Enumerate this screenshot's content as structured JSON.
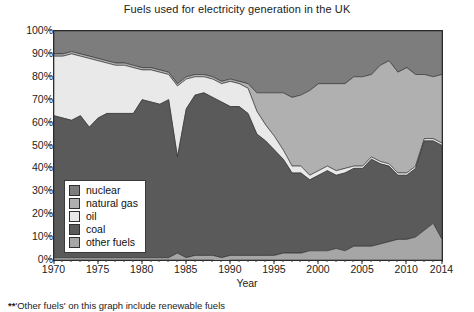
{
  "chart_data": {
    "type": "area",
    "stacked": true,
    "stack_order_top_to_bottom": [
      "nuclear",
      "natural gas",
      "oil",
      "coal",
      "other fuels"
    ],
    "title": "Fuels used for electricity generation in the UK",
    "xlabel": "Year",
    "ylabel": "",
    "xlim": [
      1970,
      2014
    ],
    "ylim": [
      0,
      100
    ],
    "grid": false,
    "legend_position": "inside-lower-left",
    "unit": "percent of electricity generated",
    "x": [
      1970,
      1971,
      1972,
      1973,
      1974,
      1975,
      1976,
      1977,
      1978,
      1979,
      1980,
      1981,
      1982,
      1983,
      1984,
      1985,
      1986,
      1987,
      1988,
      1989,
      1990,
      1991,
      1992,
      1993,
      1994,
      1995,
      1996,
      1997,
      1998,
      1999,
      2000,
      2001,
      2002,
      2003,
      2004,
      2005,
      2006,
      2007,
      2008,
      2009,
      2010,
      2011,
      2012,
      2013,
      2014
    ],
    "xticks": [
      1970,
      1975,
      1980,
      1985,
      1990,
      1995,
      2000,
      2005,
      2010,
      2014
    ],
    "yticks": [
      "0%",
      "10%",
      "20%",
      "30%",
      "40%",
      "50%",
      "60%",
      "70%",
      "80%",
      "90%",
      "100%"
    ],
    "series": [
      {
        "name": "nuclear",
        "color": "#7d7d7d",
        "values": [
          10,
          10,
          9,
          10,
          11,
          12,
          13,
          14,
          14,
          15,
          16,
          16,
          17,
          18,
          23,
          20,
          19,
          19,
          20,
          22,
          21,
          22,
          23,
          27,
          27,
          27,
          27,
          29,
          28,
          26,
          23,
          23,
          23,
          23,
          20,
          20,
          19,
          15,
          13,
          18,
          16,
          19,
          19,
          20,
          19
        ]
      },
      {
        "name": "natural gas",
        "color": "#b0b0b0",
        "values": [
          1,
          1,
          1,
          1,
          1,
          1,
          1,
          1,
          1,
          1,
          1,
          1,
          1,
          1,
          1,
          1,
          1,
          1,
          1,
          1,
          1,
          1,
          2,
          8,
          14,
          19,
          25,
          30,
          31,
          37,
          38,
          36,
          38,
          37,
          39,
          39,
          36,
          42,
          45,
          44,
          46,
          40,
          28,
          27,
          30
        ]
      },
      {
        "name": "oil",
        "color": "#e9e9e9",
        "values": [
          26,
          27,
          29,
          26,
          30,
          25,
          22,
          21,
          21,
          20,
          13,
          14,
          14,
          11,
          31,
          13,
          8,
          7,
          8,
          8,
          11,
          10,
          11,
          10,
          7,
          6,
          4,
          3,
          3,
          2,
          2,
          2,
          2,
          2,
          1,
          1,
          1,
          1,
          1,
          1,
          1,
          1,
          1,
          1,
          1
        ]
      },
      {
        "name": "coal",
        "color": "#5a5a5a",
        "values": [
          62,
          61,
          60,
          62,
          57,
          61,
          63,
          63,
          63,
          63,
          69,
          68,
          67,
          69,
          42,
          65,
          70,
          71,
          69,
          68,
          65,
          65,
          62,
          53,
          50,
          46,
          41,
          35,
          35,
          31,
          33,
          35,
          32,
          34,
          34,
          34,
          38,
          35,
          33,
          28,
          28,
          30,
          39,
          36,
          41
        ]
      },
      {
        "name": "other fuels",
        "color": "#a6a6a6",
        "values": [
          1,
          1,
          1,
          1,
          1,
          1,
          1,
          1,
          1,
          1,
          1,
          1,
          1,
          1,
          3,
          1,
          2,
          2,
          2,
          2,
          2,
          2,
          2,
          2,
          2,
          2,
          3,
          3,
          3,
          4,
          4,
          4,
          5,
          4,
          6,
          6,
          6,
          7,
          8,
          9,
          9,
          10,
          13,
          16,
          9
        ]
      }
    ]
  },
  "title": "Fuels used for electricity generation in the UK",
  "axes": {
    "x_label": "Year",
    "x_ticks": [
      "1970",
      "1975",
      "1980",
      "1985",
      "1990",
      "1995",
      "2000",
      "2005",
      "2010",
      "2014"
    ],
    "y_ticks": [
      "100%",
      "90%",
      "80%",
      "70%",
      "60%",
      "50%",
      "40%",
      "30%",
      "20%",
      "10%",
      "0%"
    ]
  },
  "legend": {
    "items": [
      {
        "label": "nuclear",
        "color": "#7d7d7d"
      },
      {
        "label": "natural gas",
        "color": "#b0b0b0"
      },
      {
        "label": "oil",
        "color": "#e9e9e9"
      },
      {
        "label": "coal",
        "color": "#5a5a5a"
      },
      {
        "label": "other fuels",
        "color": "#a6a6a6"
      }
    ]
  },
  "footnote": {
    "marker": "**",
    "text": "'Other fuels' on this graph include renewable fuels"
  }
}
